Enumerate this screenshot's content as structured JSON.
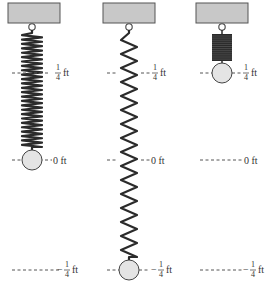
{
  "diagram": {
    "colors": {
      "ceiling_fill": "#c8c8c8",
      "ceiling_stroke": "#555555",
      "spring": "#2b2b2b",
      "mass_fill": "#e4e4e4",
      "mass_stroke": "#444444",
      "label": "#333333"
    },
    "units": "ft",
    "levels": [
      {
        "id": "top",
        "value": 0.25,
        "text_num": "1",
        "text_den": "4",
        "sign": "",
        "unit": "ft"
      },
      {
        "id": "zero",
        "value": 0,
        "text": "0 ft"
      },
      {
        "id": "bottom",
        "value": -0.25,
        "text_num": "1",
        "text_den": "4",
        "sign": "−",
        "unit": "ft"
      }
    ],
    "panels": [
      {
        "id": "equilibrium",
        "mass_position_ft": 0,
        "spring_state": "equilibrium",
        "labels": {
          "top": "1/4 ft",
          "zero": "0 ft",
          "bottom": "−1/4 ft"
        }
      },
      {
        "id": "stretched",
        "mass_position_ft": -0.25,
        "spring_state": "stretched",
        "labels": {
          "top": "1/4 ft",
          "zero": "0 ft",
          "bottom": "−1/4 ft"
        }
      },
      {
        "id": "compressed",
        "mass_position_ft": 0.25,
        "spring_state": "compressed",
        "labels": {
          "top": "1/4 ft",
          "zero": "0 ft",
          "bottom": "−1/4 ft"
        }
      }
    ],
    "label_text": {
      "one": "1",
      "four": "4",
      "ft": "ft",
      "zero_ft": "0 ft",
      "minus": "−"
    }
  }
}
